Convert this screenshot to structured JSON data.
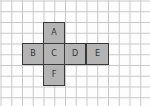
{
  "diagram": {
    "type": "cube-net",
    "grid": {
      "cell_px": 10.75,
      "line_color": "#c8c8c8",
      "background": "#fdfdfd"
    },
    "face_style": {
      "fill": "#b4b4b4",
      "stroke": "#3a3a3a",
      "text_color": "#333333"
    },
    "faces": [
      {
        "label": "A",
        "col": 1,
        "row": 0
      },
      {
        "label": "B",
        "col": 0,
        "row": 1
      },
      {
        "label": "C",
        "col": 1,
        "row": 1
      },
      {
        "label": "D",
        "col": 2,
        "row": 1
      },
      {
        "label": "E",
        "col": 3,
        "row": 1
      },
      {
        "label": "F",
        "col": 1,
        "row": 2
      }
    ]
  }
}
